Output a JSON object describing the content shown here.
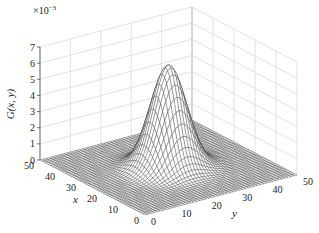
{
  "chart_data": {
    "type": "surface",
    "title": "",
    "function": "G(x, y) = 1/(2*pi*sigma^2) * exp(-((x-25)^2 + (y-25)^2)/(2*sigma^2))",
    "params": {
      "mu_x": 25,
      "mu_y": 25,
      "sigma": 5,
      "grid_n": 51
    },
    "peak": {
      "x": 25,
      "y": 25,
      "z": 0.00637
    },
    "xlabel": "x",
    "ylabel": "y",
    "zlabel": "G(x, y)",
    "z_exponent_label": "×10",
    "z_exponent_power": "−3",
    "xlim": [
      0,
      50
    ],
    "ylim": [
      0,
      50
    ],
    "zlim": [
      0,
      0.007
    ],
    "x_ticks": [
      "0",
      "10",
      "20",
      "30",
      "40",
      "50"
    ],
    "y_ticks": [
      "0",
      "10",
      "20",
      "30",
      "40",
      "50"
    ],
    "z_ticks": [
      "0",
      "1",
      "2",
      "3",
      "4",
      "5",
      "6",
      "7"
    ],
    "grid": true,
    "colormap": "gray mesh"
  },
  "labels": {
    "zlabel": "G(x, y)",
    "xlabel": "x",
    "ylabel": "y",
    "exp_base": "×10",
    "exp_power": "−3"
  }
}
